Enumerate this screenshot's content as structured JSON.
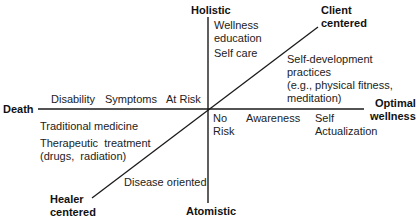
{
  "diagram": {
    "axes": {
      "horizontal": {
        "left_label": "Death",
        "right_label": "Optimal\nwellness"
      },
      "vertical": {
        "top_label": "Holistic",
        "bottom_label": "Atomistic"
      },
      "diagonal": {
        "top_label": "Client\ncentered",
        "bottom_label": "Healer\ncentered"
      }
    },
    "labels": {
      "disability": "Disability",
      "symptoms": "Symptoms",
      "at_risk": "At Risk",
      "no_risk": "No\nRisk",
      "awareness": "Awareness",
      "self_actualization": "Self\nActualization",
      "wellness_education": "Wellness\neducation",
      "self_care": "Self care",
      "self_development": "Self-development\npractices\n(e.g., physical fitness,\nmeditation)",
      "traditional_medicine": "Traditional medicine",
      "therapeutic_treatment": "Therapeutic  treatment\n(drugs,  radiation)",
      "disease_oriented": "Disease oriented"
    },
    "line_color": "#1a1a1a"
  }
}
